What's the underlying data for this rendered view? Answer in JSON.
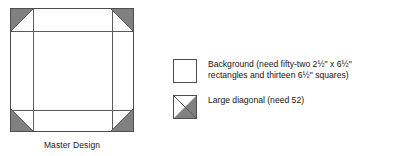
{
  "figure": {
    "caption": "Master Design",
    "block": {
      "corner_unit_name": "large-diagonal-unit",
      "corner_triangles": [
        {
          "position": "top-left",
          "fill_half": "upper-left"
        },
        {
          "position": "top-right",
          "fill_half": "upper-right"
        },
        {
          "position": "bottom-left",
          "fill_half": "lower-left"
        },
        {
          "position": "bottom-right",
          "fill_half": "lower-right"
        }
      ]
    }
  },
  "legend": {
    "items": [
      {
        "swatch": "background-square",
        "label": "Background (need fifty-two 2½\" x 6½\" rectangles and thirteen 6½\" squares)"
      },
      {
        "swatch": "large-diagonal-square",
        "label": "Large diagonal (need 52)"
      }
    ]
  },
  "colors": {
    "fabric_gray": "#808080",
    "line": "#4d4d4d",
    "background": "#ffffff",
    "text": "#141414"
  }
}
